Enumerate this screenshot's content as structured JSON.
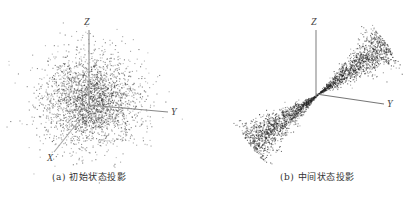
{
  "figure": {
    "panels": [
      {
        "id": "a",
        "caption": "(a) 初始状态投影",
        "axes": {
          "x": "X",
          "y": "Y",
          "z": "Z"
        },
        "distribution": "spherical gaussian cloud centered at origin"
      },
      {
        "id": "b",
        "caption": "(b) 中间状态投影",
        "axes": {
          "y": "Y",
          "z": "Z"
        },
        "distribution": "elongated double-cone streak along diagonal through origin"
      }
    ]
  },
  "chart_data": [
    {
      "type": "scatter",
      "title": "(a) 初始状态投影",
      "dimensions": 3,
      "axis_labels": [
        "X",
        "Y",
        "Z"
      ],
      "description": "Dense isotropic point cloud, densest at center, fading radially",
      "grid": false,
      "legend": false
    },
    {
      "type": "scatter",
      "title": "(b) 中间状态投影",
      "dimensions": 3,
      "axis_labels": [
        "Y",
        "Z"
      ],
      "description": "Points concentrated along a diagonal line from lower-left to upper-right, passing through origin, forming two cone-shaped lobes",
      "grid": false,
      "legend": false
    }
  ],
  "colors": {
    "points": "#222222",
    "axes": "#888888",
    "background": "#ffffff"
  }
}
